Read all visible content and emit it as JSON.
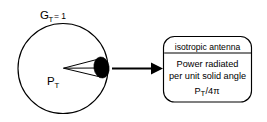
{
  "figure": {
    "background_color": "#ffffff",
    "stroke_color": "#000000",
    "fill_color": "#000000",
    "gain_label": {
      "base": "G",
      "subscript": "T",
      "equals": "= 1"
    },
    "source_label": {
      "base": "P",
      "subscript": "T"
    },
    "box": {
      "header": "isotropic antenna",
      "lines": [
        "Power radiated",
        "per unit solid angle"
      ],
      "formula": {
        "base": "P",
        "subscript": "T",
        "rest": "/4π"
      }
    },
    "icons": {
      "arrow": "arrow-right-icon",
      "cone": "solid-angle-cone-icon",
      "blob": "radiating-patch-icon",
      "circle": "isotropic-sphere-icon"
    }
  }
}
